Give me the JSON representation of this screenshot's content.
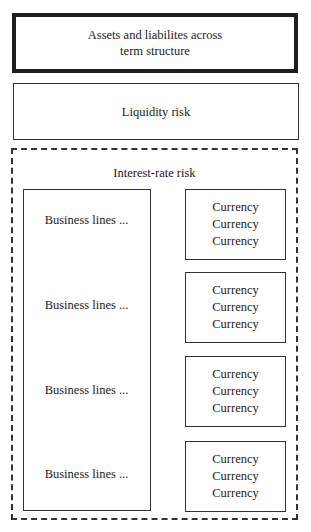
{
  "diagram": {
    "top_box": {
      "label_line1": "Assets and liabilites across",
      "label_line2": "term structure"
    },
    "liquidity_box": {
      "label": "Liquidity risk"
    },
    "interest_rate_container": {
      "label": "Interest-rate risk",
      "business_lines": [
        "Business lines ...",
        "Business lines ...",
        "Business lines ...",
        "Business lines ..."
      ],
      "currency_groups": [
        [
          "Currency",
          "Currency",
          "Currency"
        ],
        [
          "Currency",
          "Currency",
          "Currency"
        ],
        [
          "Currency",
          "Currency",
          "Currency"
        ],
        [
          "Currency",
          "Currency",
          "Currency"
        ]
      ]
    }
  }
}
